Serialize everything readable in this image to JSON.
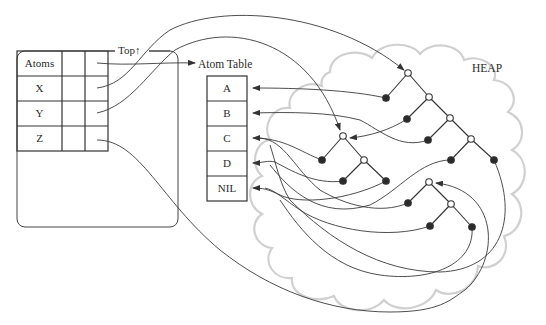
{
  "diagram": {
    "type": "memory-layout",
    "heap_label": "HEAP",
    "top_label": "Top↑",
    "atom_table_label": "Atom Table",
    "symbol_table": {
      "rows": [
        {
          "label": "Atoms",
          "points_to": "atom-table"
        },
        {
          "label": "X",
          "points_to": "tree-1-root"
        },
        {
          "label": "Y",
          "points_to": "tree-2-root"
        },
        {
          "label": "Z",
          "points_to": "tree-3-root"
        }
      ]
    },
    "atom_table": {
      "entries": [
        "A",
        "B",
        "C",
        "D",
        "NIL"
      ]
    },
    "heap_trees": [
      {
        "name": "tree-1",
        "nodes": 9
      },
      {
        "name": "tree-2",
        "nodes": 5
      },
      {
        "name": "tree-3",
        "nodes": 5
      }
    ],
    "colors": {
      "line": "#3a3a3a",
      "cloud": "#cfcfcf",
      "node_fill": "#2a2a2a",
      "node_open": "#ffffff"
    }
  }
}
